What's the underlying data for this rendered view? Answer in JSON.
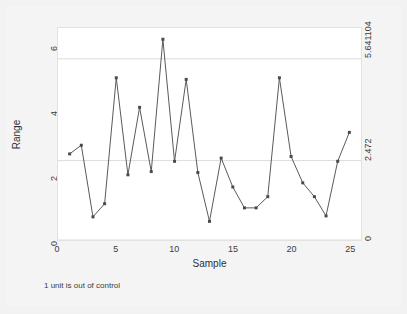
{
  "chart_data": {
    "type": "line",
    "title": "",
    "subtitle": "",
    "xlabel": "Sample",
    "ylabel": "Range",
    "x": [
      1,
      2,
      3,
      4,
      5,
      6,
      7,
      8,
      9,
      10,
      11,
      12,
      13,
      14,
      15,
      16,
      17,
      18,
      19,
      20,
      21,
      22,
      23,
      24,
      25
    ],
    "values": [
      2.68,
      2.95,
      0.72,
      1.13,
      5.05,
      2.03,
      4.13,
      2.13,
      6.25,
      2.45,
      5.0,
      2.1,
      0.58,
      2.55,
      1.65,
      1.0,
      1.0,
      1.35,
      5.05,
      2.6,
      1.78,
      1.35,
      0.75,
      2.45,
      3.35
    ],
    "series": [
      {
        "name": "Range",
        "values": [
          2.68,
          2.95,
          0.72,
          1.13,
          5.05,
          2.03,
          4.13,
          2.13,
          6.25,
          2.45,
          5.0,
          2.1,
          0.58,
          2.55,
          1.65,
          1.0,
          1.0,
          1.35,
          5.05,
          2.6,
          1.78,
          1.35,
          0.75,
          2.45,
          3.35
        ]
      }
    ],
    "xlim": [
      0,
      26
    ],
    "ylim": [
      0,
      6.6
    ],
    "xticks": [
      0,
      5,
      10,
      15,
      20,
      25
    ],
    "xtick_labels": [
      "0",
      "5",
      "10",
      "15",
      "20",
      "25"
    ],
    "yticks": [
      0,
      2,
      4,
      6
    ],
    "ytick_labels": [
      "0",
      "2",
      "4",
      "6"
    ],
    "grid": false,
    "legend": "none",
    "control_limits": [
      {
        "name": "UCL",
        "value": 5.641104,
        "label": "5.641104"
      },
      {
        "name": "CL",
        "value": 2.472,
        "label": "2.472"
      },
      {
        "name": "LCL",
        "value": 0,
        "label": "0"
      }
    ],
    "annotation": "1 unit is out of control",
    "marker": "filled-square",
    "line_color": "#5a5a5a",
    "marker_color": "#4a4a4a",
    "limit_line_color": "#dcdcdc",
    "plot_background": "#ffffff",
    "figure_background": "#f2f2f2"
  },
  "axes": {
    "y_title": "Range",
    "x_title": "Sample"
  },
  "footnote": {
    "text": "1 unit is out of control"
  }
}
